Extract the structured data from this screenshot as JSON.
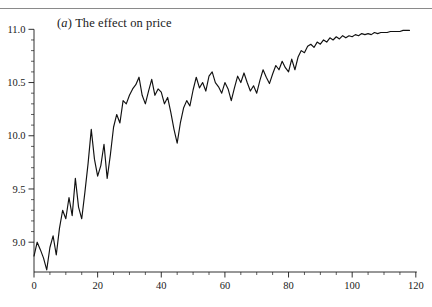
{
  "figure": {
    "top_rule_color": "#8a8a8a",
    "background": "#ffffff"
  },
  "title": {
    "panel_label": "(a)",
    "panel_letter": "a",
    "text": "The effect on price",
    "full": "(a) The effect on price"
  },
  "chart_data": {
    "type": "line",
    "xlabel": "",
    "ylabel": "",
    "xlim": [
      0,
      121
    ],
    "ylim": [
      8.72,
      11.05
    ],
    "grid": false,
    "legend": null,
    "line_color": "#111111",
    "x_ticks_major": [
      0,
      20,
      40,
      60,
      80,
      100,
      120
    ],
    "x_tick_labels": [
      "0",
      "20",
      "40",
      "60",
      "80",
      "100",
      "120"
    ],
    "x_tick_minor_step": 5,
    "y_ticks_major": [
      9.0,
      9.5,
      10.0,
      10.5,
      11.0
    ],
    "y_tick_labels": [
      "9.0",
      "9.5",
      "10.0",
      "10.5",
      "11.0"
    ],
    "y_tick_minor_step": 0.1,
    "x": [
      0,
      1,
      2,
      3,
      4,
      5,
      6,
      7,
      8,
      9,
      10,
      11,
      12,
      13,
      14,
      15,
      16,
      17,
      18,
      19,
      20,
      21,
      22,
      23,
      24,
      25,
      26,
      27,
      28,
      29,
      30,
      31,
      32,
      33,
      34,
      35,
      36,
      37,
      38,
      39,
      40,
      41,
      42,
      43,
      44,
      45,
      46,
      47,
      48,
      49,
      50,
      51,
      52,
      53,
      54,
      55,
      56,
      57,
      58,
      59,
      60,
      61,
      62,
      63,
      64,
      65,
      66,
      67,
      68,
      69,
      70,
      71,
      72,
      73,
      74,
      75,
      76,
      77,
      78,
      79,
      80,
      81,
      82,
      83,
      84,
      85,
      86,
      87,
      88,
      89,
      90,
      91,
      92,
      93,
      94,
      95,
      96,
      97,
      98,
      99,
      100,
      101,
      102,
      103,
      104,
      105,
      106,
      107,
      108,
      109,
      110,
      111,
      112,
      113,
      114,
      115,
      116,
      117,
      118
    ],
    "values": [
      8.87,
      9.0,
      8.93,
      8.85,
      8.74,
      8.95,
      9.06,
      8.88,
      9.13,
      9.3,
      9.22,
      9.42,
      9.25,
      9.6,
      9.33,
      9.22,
      9.47,
      9.74,
      10.06,
      9.78,
      9.62,
      9.72,
      9.92,
      9.6,
      9.82,
      10.08,
      10.2,
      10.12,
      10.33,
      10.3,
      10.38,
      10.44,
      10.48,
      10.55,
      10.38,
      10.3,
      10.42,
      10.53,
      10.38,
      10.44,
      10.41,
      10.3,
      10.36,
      10.22,
      10.06,
      9.93,
      10.12,
      10.26,
      10.33,
      10.28,
      10.43,
      10.55,
      10.45,
      10.5,
      10.42,
      10.56,
      10.6,
      10.5,
      10.46,
      10.4,
      10.5,
      10.44,
      10.33,
      10.45,
      10.56,
      10.5,
      10.59,
      10.5,
      10.42,
      10.47,
      10.4,
      10.52,
      10.62,
      10.55,
      10.49,
      10.58,
      10.66,
      10.62,
      10.7,
      10.64,
      10.6,
      10.72,
      10.62,
      10.74,
      10.8,
      10.78,
      10.84,
      10.86,
      10.83,
      10.88,
      10.86,
      10.9,
      10.88,
      10.92,
      10.9,
      10.93,
      10.91,
      10.94,
      10.92,
      10.94,
      10.93,
      10.95,
      10.94,
      10.96,
      10.95,
      10.96,
      10.95,
      10.97,
      10.96,
      10.97,
      10.97,
      10.97,
      10.98,
      10.98,
      10.98,
      10.98,
      10.99,
      10.99,
      10.99
    ]
  }
}
